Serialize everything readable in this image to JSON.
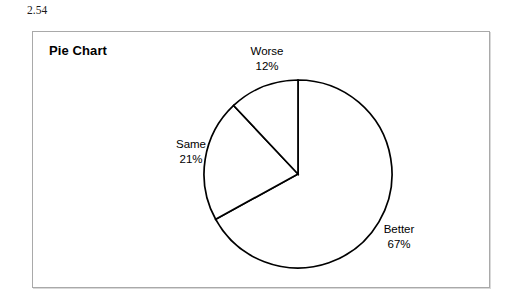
{
  "figure": {
    "number": "2.54"
  },
  "panel": {
    "title": "Pie Chart"
  },
  "chart_data": {
    "type": "pie",
    "title": "Pie Chart",
    "categories": [
      "Better",
      "Same",
      "Worse"
    ],
    "values": [
      67,
      21,
      12
    ],
    "value_suffix": "%",
    "labels": [
      {
        "name": "Worse",
        "value": "12%",
        "percent": 12
      },
      {
        "name": "Same",
        "value": "21%",
        "percent": 21
      },
      {
        "name": "Better",
        "value": "67%",
        "percent": 67
      }
    ],
    "start_angle_deg": 0,
    "direction": "clockwise",
    "slice_order_clockwise_from_top": [
      "Better",
      "Same",
      "Worse"
    ],
    "legend": "none",
    "grid": false,
    "colors": {
      "slice_fill": "#ffffff",
      "slice_stroke": "#000000",
      "panel_border": "#a9a9a9",
      "text": "#000000",
      "background": "#ffffff"
    },
    "geometry": {
      "center_x": 265,
      "center_y": 142,
      "radius": 94
    }
  }
}
